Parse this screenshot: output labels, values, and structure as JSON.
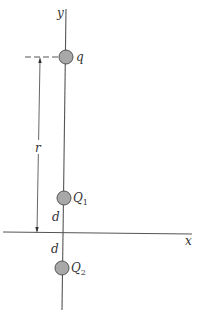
{
  "diagram": {
    "axes": {
      "x_label": "x",
      "y_label": "y"
    },
    "charges": [
      {
        "id": "q",
        "label": "q",
        "sub": "",
        "position": "y = r"
      },
      {
        "id": "Q1",
        "label": "Q",
        "sub": "1",
        "position": "y = d"
      },
      {
        "id": "Q2",
        "label": "Q",
        "sub": "2",
        "position": "y = -d"
      }
    ],
    "dimensions": {
      "r_label": "r",
      "d_upper_label": "d",
      "d_lower_label": "d"
    },
    "colors": {
      "line": "#555555",
      "charge_fill": "#a8a8a8",
      "charge_stroke": "#555555",
      "text": "#333333"
    }
  }
}
